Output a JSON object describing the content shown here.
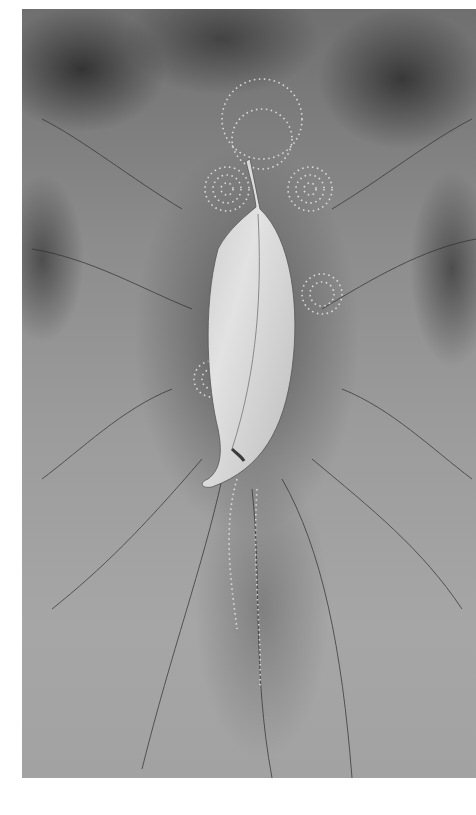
{
  "artwork": {
    "subject": "leaf",
    "style": "grayscale ink wash with dotted concentric circles",
    "colors": {
      "background": "#ffffff",
      "wash_dark": "#3a3a3a",
      "wash_mid": "#8c8c8c",
      "wash_light": "#a6a6a6",
      "leaf": "#d8d8d8",
      "dots": "#e8e8e8"
    }
  }
}
